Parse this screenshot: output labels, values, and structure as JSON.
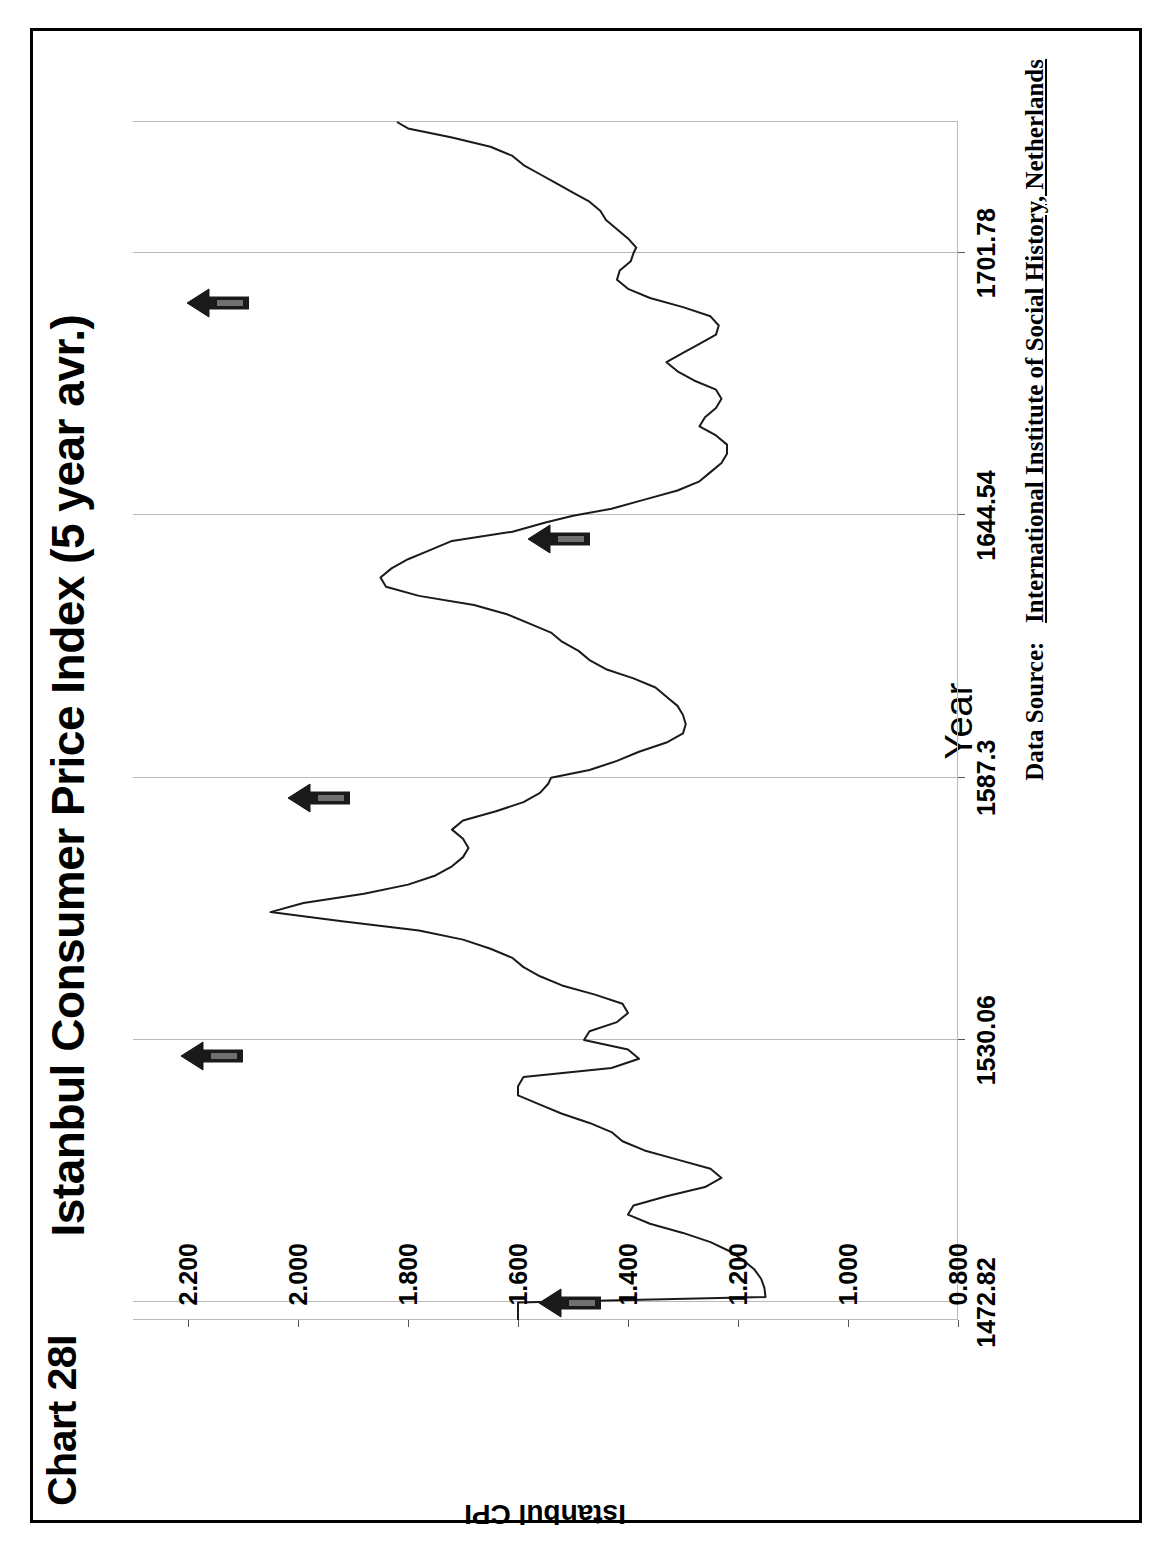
{
  "chart_label": "Chart 28I",
  "axis_titles": {
    "x": "Year",
    "y": "Istanbul CPI"
  },
  "source": {
    "prefix": "Data Source:",
    "value": "International Institute of Social History, Netherlands"
  },
  "colors": {
    "line": "#1a1a1a",
    "grid": "#b9b9b9",
    "text": "#000000",
    "arrow": "#1a1a1a",
    "frame": "#000000"
  },
  "chart_data": {
    "type": "line",
    "title": "Istanbul Consumer Price Index (5 year avr.)",
    "xlabel": "Year",
    "ylabel": "Istanbul CPI",
    "xlim": [
      1469.0,
      1730.4
    ],
    "ylim": [
      0.8,
      2.3
    ],
    "xticks": [
      1472.82,
      1530.06,
      1587.3,
      1644.54,
      1701.78
    ],
    "xticklabels": [
      "1472.82",
      "1530.06",
      "1587.3",
      "1644.54",
      "1701.78"
    ],
    "yticks": [
      0.8,
      1.0,
      1.2,
      1.4,
      1.6,
      1.8,
      2.0,
      2.2
    ],
    "yticklabels": [
      "0.800",
      "1.000",
      "1.200",
      "1.400",
      "1.600",
      "1.800",
      "2.000",
      "2.200"
    ],
    "grid": {
      "vertical": true,
      "horizontal": false
    },
    "legend": null,
    "series": [
      {
        "name": "Istanbul CPI (5 year avr.)",
        "x": [
          1469.0,
          1471.0,
          1472.8,
          1474.0,
          1476.0,
          1478.0,
          1480.0,
          1482.0,
          1484.0,
          1486.0,
          1488.0,
          1490.0,
          1492.0,
          1494.0,
          1496.0,
          1498.0,
          1500.0,
          1502.0,
          1504.0,
          1506.0,
          1508.0,
          1510.0,
          1512.0,
          1514.0,
          1516.0,
          1518.0,
          1520.0,
          1522.0,
          1524.0,
          1526.0,
          1528.0,
          1530.1,
          1532.0,
          1534.0,
          1536.0,
          1538.0,
          1540.0,
          1542.0,
          1544.0,
          1546.0,
          1548.0,
          1550.0,
          1552.0,
          1554.0,
          1556.0,
          1558.0,
          1560.0,
          1562.0,
          1564.0,
          1566.0,
          1568.0,
          1570.0,
          1572.0,
          1574.0,
          1576.0,
          1578.0,
          1580.0,
          1582.0,
          1584.0,
          1586.0,
          1587.3,
          1589.0,
          1591.0,
          1593.0,
          1595.0,
          1597.0,
          1599.0,
          1601.0,
          1603.0,
          1605.0,
          1607.0,
          1609.0,
          1611.0,
          1613.0,
          1615.0,
          1617.0,
          1619.0,
          1621.0,
          1623.0,
          1625.0,
          1627.0,
          1629.0,
          1631.0,
          1633.0,
          1635.0,
          1637.0,
          1639.0,
          1641.0,
          1643.0,
          1644.5,
          1646.0,
          1648.0,
          1650.0,
          1652.0,
          1654.0,
          1656.0,
          1658.0,
          1660.0,
          1662.0,
          1664.0,
          1666.0,
          1668.0,
          1670.0,
          1672.0,
          1674.0,
          1676.0,
          1678.0,
          1680.0,
          1682.0,
          1684.0,
          1686.0,
          1688.0,
          1690.0,
          1692.0,
          1694.0,
          1696.0,
          1698.0,
          1700.0,
          1701.8,
          1703.0,
          1705.0,
          1707.0,
          1709.0,
          1711.0,
          1713.0,
          1715.0,
          1717.0,
          1719.0,
          1721.0,
          1723.0,
          1725.0,
          1727.0,
          1729.0,
          1730.4
        ],
        "y": [
          1.6,
          1.6,
          1.6,
          1.15,
          1.152,
          1.158,
          1.17,
          1.19,
          1.215,
          1.25,
          1.3,
          1.36,
          1.4,
          1.39,
          1.33,
          1.26,
          1.23,
          1.25,
          1.31,
          1.37,
          1.41,
          1.43,
          1.47,
          1.52,
          1.56,
          1.6,
          1.6,
          1.59,
          1.43,
          1.38,
          1.4,
          1.48,
          1.47,
          1.42,
          1.4,
          1.41,
          1.46,
          1.52,
          1.56,
          1.59,
          1.61,
          1.65,
          1.7,
          1.78,
          1.92,
          2.05,
          1.99,
          1.88,
          1.8,
          1.75,
          1.72,
          1.7,
          1.69,
          1.7,
          1.72,
          1.7,
          1.64,
          1.59,
          1.56,
          1.545,
          1.54,
          1.47,
          1.42,
          1.38,
          1.33,
          1.3,
          1.295,
          1.3,
          1.31,
          1.33,
          1.35,
          1.39,
          1.44,
          1.47,
          1.49,
          1.52,
          1.54,
          1.58,
          1.62,
          1.68,
          1.78,
          1.84,
          1.85,
          1.83,
          1.8,
          1.76,
          1.72,
          1.61,
          1.55,
          1.5,
          1.43,
          1.37,
          1.31,
          1.27,
          1.25,
          1.23,
          1.22,
          1.22,
          1.24,
          1.27,
          1.26,
          1.24,
          1.23,
          1.24,
          1.28,
          1.31,
          1.33,
          1.3,
          1.27,
          1.24,
          1.235,
          1.25,
          1.3,
          1.36,
          1.4,
          1.42,
          1.415,
          1.395,
          1.39,
          1.385,
          1.4,
          1.42,
          1.44,
          1.45,
          1.47,
          1.5,
          1.53,
          1.56,
          1.59,
          1.61,
          1.65,
          1.72,
          1.8,
          1.82
        ]
      }
    ],
    "annotations": [
      {
        "label": "arrow-marker-1",
        "x": 1472.8,
        "y": 1.45,
        "shape": "up-arrow"
      },
      {
        "label": "arrow-marker-2",
        "x": 1526.5,
        "y": 2.1,
        "shape": "up-arrow"
      },
      {
        "label": "arrow-marker-3",
        "x": 1583.0,
        "y": 1.905,
        "shape": "up-arrow"
      },
      {
        "label": "arrow-marker-4",
        "x": 1639.5,
        "y": 1.47,
        "shape": "up-arrow"
      },
      {
        "label": "arrow-marker-5",
        "x": 1691.0,
        "y": 2.09,
        "shape": "up-arrow"
      }
    ]
  }
}
